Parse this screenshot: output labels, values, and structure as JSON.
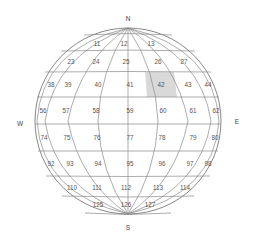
{
  "compass": {
    "north": "N",
    "south": "S",
    "east": "E",
    "west": "W"
  },
  "highlight_color": "#d9d9d9",
  "highlighted_cell": "42",
  "rows": [
    {
      "cells": [
        {
          "label": "11",
          "x": 97,
          "y": 44
        },
        {
          "label": "12",
          "x": 124,
          "y": 44
        },
        {
          "label": "13",
          "x": 151,
          "y": 44
        }
      ]
    },
    {
      "cells": [
        {
          "label": "23",
          "x": 71,
          "y": 62
        },
        {
          "label": "24",
          "x": 96,
          "y": 62
        },
        {
          "label": "25",
          "x": 126,
          "y": 62
        },
        {
          "label": "26",
          "x": 158,
          "y": 62
        },
        {
          "label": "27",
          "x": 184,
          "y": 62
        }
      ]
    },
    {
      "cells": [
        {
          "label": "38",
          "x": 51,
          "y": 85
        },
        {
          "label": "39",
          "x": 68,
          "y": 85
        },
        {
          "label": "40",
          "x": 98,
          "y": 85
        },
        {
          "label": "41",
          "x": 130,
          "y": 85
        },
        {
          "label": "42",
          "x": 161,
          "y": 85
        },
        {
          "label": "43",
          "x": 188,
          "y": 85
        },
        {
          "label": "44",
          "x": 208,
          "y": 85
        }
      ]
    },
    {
      "cells": [
        {
          "label": "56",
          "x": 43,
          "y": 111
        },
        {
          "label": "57",
          "x": 66,
          "y": 111
        },
        {
          "label": "58",
          "x": 96,
          "y": 111
        },
        {
          "label": "59",
          "x": 130,
          "y": 111
        },
        {
          "label": "60",
          "x": 163,
          "y": 111
        },
        {
          "label": "61",
          "x": 193,
          "y": 111
        },
        {
          "label": "62",
          "x": 216,
          "y": 111
        }
      ]
    },
    {
      "cells": [
        {
          "label": "74",
          "x": 44,
          "y": 138
        },
        {
          "label": "75",
          "x": 67,
          "y": 138
        },
        {
          "label": "76",
          "x": 97,
          "y": 138
        },
        {
          "label": "77",
          "x": 130,
          "y": 138
        },
        {
          "label": "78",
          "x": 162,
          "y": 138
        },
        {
          "label": "79",
          "x": 193,
          "y": 138
        },
        {
          "label": "80",
          "x": 215,
          "y": 138
        }
      ]
    },
    {
      "cells": [
        {
          "label": "92",
          "x": 51,
          "y": 164
        },
        {
          "label": "93",
          "x": 70,
          "y": 164
        },
        {
          "label": "94",
          "x": 98,
          "y": 164
        },
        {
          "label": "95",
          "x": 130,
          "y": 164
        },
        {
          "label": "96",
          "x": 162,
          "y": 164
        },
        {
          "label": "97",
          "x": 190,
          "y": 164
        },
        {
          "label": "98",
          "x": 208,
          "y": 164
        }
      ]
    },
    {
      "cells": [
        {
          "label": "110",
          "x": 72,
          "y": 188
        },
        {
          "label": "111",
          "x": 97,
          "y": 188
        },
        {
          "label": "112",
          "x": 126,
          "y": 188
        },
        {
          "label": "113",
          "x": 158,
          "y": 188
        },
        {
          "label": "114",
          "x": 185,
          "y": 188
        }
      ]
    },
    {
      "cells": [
        {
          "label": "125",
          "x": 98,
          "y": 205
        },
        {
          "label": "126",
          "x": 126,
          "y": 205
        },
        {
          "label": "127",
          "x": 150,
          "y": 205
        }
      ]
    }
  ]
}
